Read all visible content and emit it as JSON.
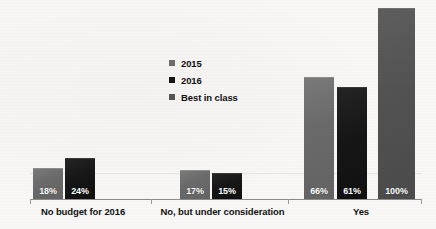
{
  "chart_data": {
    "type": "bar",
    "title": "",
    "subtitle": "",
    "xlabel": "",
    "ylabel": "",
    "ylim": [
      0,
      100
    ],
    "grid": false,
    "legend_position": "center-left-inside",
    "categories": [
      "No budget for 2016",
      "No, but under consideration",
      "Yes"
    ],
    "series": [
      {
        "name": "2015",
        "color": "#6e6e6e",
        "values": [
          18,
          61,
          66
        ],
        "labels": [
          "18%",
          "",
          "66%"
        ]
      },
      {
        "name": "2016",
        "color": "#161616",
        "values": [
          24,
          15,
          61
        ],
        "labels": [
          "24%",
          "15%",
          "61%"
        ]
      },
      {
        "name": "Best in class",
        "color": "#555555",
        "values": [
          null,
          null,
          100
        ],
        "labels": [
          "",
          "",
          "100%"
        ]
      }
    ],
    "points": [
      {
        "category": "No budget for 2016",
        "series": "2015",
        "value": 18,
        "label": "18%"
      },
      {
        "category": "No budget for 2016",
        "series": "2016",
        "value": 24,
        "label": "24%"
      },
      {
        "category": "No, but under consideration",
        "series": "2015",
        "value": 17,
        "label": "17%"
      },
      {
        "category": "No, but under consideration",
        "series": "2016",
        "value": 15,
        "label": "15%"
      },
      {
        "category": "Yes",
        "series": "2015",
        "value": 66,
        "label": "66%"
      },
      {
        "category": "Yes",
        "series": "2016",
        "value": 61,
        "label": "61%"
      },
      {
        "category": "Yes",
        "series": "Best in class",
        "value": 100,
        "label": "100%"
      }
    ]
  },
  "legend": {
    "items": [
      {
        "label": "2015",
        "key": "s2015"
      },
      {
        "label": "2016",
        "key": "s2016"
      },
      {
        "label": "Best in class",
        "key": "sbest"
      }
    ]
  },
  "bars": [
    {
      "name": "bar-no-budget-2015",
      "series": "s2015",
      "value": "18%",
      "x": 33,
      "w": 30,
      "h": 31
    },
    {
      "name": "bar-no-budget-2016",
      "series": "s2016",
      "value": "24%",
      "x": 65,
      "w": 30,
      "h": 41
    },
    {
      "name": "bar-consideration-2015",
      "series": "s2015",
      "value": "17%",
      "x": 180,
      "w": 30,
      "h": 29
    },
    {
      "name": "bar-consideration-2016",
      "series": "s2016",
      "value": "15%",
      "x": 212,
      "w": 30,
      "h": 26
    },
    {
      "name": "bar-yes-2015",
      "series": "s2015",
      "value": "66%",
      "x": 304,
      "w": 30,
      "h": 122
    },
    {
      "name": "bar-yes-2016",
      "series": "s2016",
      "value": "61%",
      "x": 337,
      "w": 30,
      "h": 112
    },
    {
      "name": "bar-yes-best",
      "series": "sbest",
      "value": "100%",
      "x": 378,
      "w": 37,
      "h": 191
    }
  ],
  "axis": {
    "ticks_x": [
      30,
      151,
      288,
      421
    ],
    "categories": [
      {
        "label": "No budget for 2016",
        "left": 22,
        "width": 122
      },
      {
        "label": "No, but under consideration",
        "left": 150,
        "width": 145
      },
      {
        "label": "Yes",
        "left": 300,
        "width": 122
      }
    ]
  }
}
